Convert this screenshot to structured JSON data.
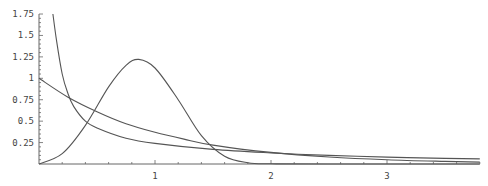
{
  "chart_data": {
    "type": "line",
    "title": "",
    "xlabel": "",
    "ylabel": "",
    "xlim": [
      0,
      3.8
    ],
    "ylim": [
      0,
      1.75
    ],
    "grid": false,
    "legend": null,
    "x_ticks": [
      "1",
      "2",
      "3"
    ],
    "x_tick_values": [
      1,
      2,
      3
    ],
    "y_ticks": [
      "0.25",
      "0.5",
      "0.75",
      "1",
      "1.25",
      "1.5",
      "1.75"
    ],
    "y_tick_values": [
      0.25,
      0.5,
      0.75,
      1,
      1.25,
      1.5,
      1.75
    ],
    "series": [
      {
        "name": "exponential-decay",
        "x": [
          0,
          0.25,
          0.5,
          0.75,
          1,
          1.25,
          1.5,
          2,
          2.5,
          3,
          3.5,
          3.8
        ],
        "y": [
          1.0,
          0.78,
          0.61,
          0.47,
          0.37,
          0.29,
          0.22,
          0.135,
          0.082,
          0.05,
          0.03,
          0.022
        ]
      },
      {
        "name": "inverse-sqrt-decay",
        "x": [
          0.12,
          0.15,
          0.2,
          0.25,
          0.3,
          0.4,
          0.5,
          0.75,
          1,
          1.5,
          2,
          2.5,
          3,
          3.5,
          3.8
        ],
        "y": [
          1.75,
          1.45,
          1.05,
          0.82,
          0.67,
          0.5,
          0.42,
          0.3,
          0.24,
          0.17,
          0.13,
          0.1,
          0.08,
          0.065,
          0.06
        ],
        "note": "diverges toward x=0"
      },
      {
        "name": "unimodal-bump",
        "x": [
          0,
          0.2,
          0.4,
          0.6,
          0.75,
          0.86,
          1.0,
          1.2,
          1.4,
          1.6,
          1.8,
          2.0,
          2.5,
          3.8
        ],
        "y": [
          0,
          0.12,
          0.45,
          0.9,
          1.15,
          1.22,
          1.12,
          0.75,
          0.33,
          0.09,
          0.015,
          0.002,
          0,
          0
        ],
        "peak": {
          "x": 0.86,
          "y": 1.22
        }
      }
    ]
  },
  "axes": {
    "origin_px": [
      39,
      164
    ],
    "x_px_per_unit": 116,
    "y_px_per_unit": 85.7
  },
  "style": {
    "line_color": "#555555",
    "axis_color": "#666666",
    "background": "#ffffff"
  }
}
